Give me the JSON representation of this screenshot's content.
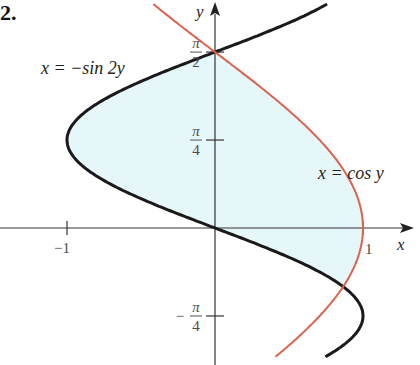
{
  "problem_number": "2.",
  "axes": {
    "x_label": "x",
    "y_label": "y",
    "x_ticks": [
      {
        "value": -1,
        "label": "−1"
      },
      {
        "value": 1,
        "label": "1"
      }
    ],
    "y_ticks": [
      {
        "value": 1.5708,
        "label_num": "π",
        "label_den": "2",
        "sign": ""
      },
      {
        "value": 0.7854,
        "label_num": "π",
        "label_den": "4",
        "sign": ""
      },
      {
        "value": -0.7854,
        "label_num": "π",
        "label_den": "4",
        "sign": "−"
      }
    ]
  },
  "curves": [
    {
      "name": "sine-curve",
      "label": "x = −sin 2y",
      "color": "#1a1a1a"
    },
    {
      "name": "cosine-curve",
      "label": "x = cos y",
      "color": "#e0604f"
    }
  ],
  "shaded_region": {
    "color": "#e6f7fa",
    "description": "Region between x = −sin 2y and x = cos y, from y = −π/6 to y = π/2"
  },
  "chart_data": {
    "type": "line",
    "title": "",
    "xlabel": "x",
    "ylabel": "y",
    "xlim": [
      -1.45,
      1.33
    ],
    "ylim": [
      -1.2,
      2.0
    ],
    "x_ticks": [
      -1,
      1
    ],
    "y_ticks": [
      "π/2",
      "π/4",
      "−π/4"
    ],
    "grid": false,
    "series": [
      {
        "name": "x = −sin 2y",
        "param": "y",
        "expr": "-sin(2y)",
        "y_range": [
          -1.15,
          2.0
        ],
        "color": "#1a1a1a"
      },
      {
        "name": "x = cos y",
        "param": "y",
        "expr": "cos(y)",
        "y_range": [
          -1.15,
          2.0
        ],
        "color": "#e0604f"
      }
    ],
    "intersections": [
      {
        "x": 0,
        "y": 1.5708,
        "label": "(0, π/2)"
      },
      {
        "x": 0.866,
        "y": -0.5236,
        "label": "(√3/2, −π/6)"
      }
    ],
    "shaded": {
      "between": [
        "x = −sin 2y",
        "x = cos y"
      ],
      "y_from": -0.5236,
      "y_to": 1.5708
    }
  }
}
